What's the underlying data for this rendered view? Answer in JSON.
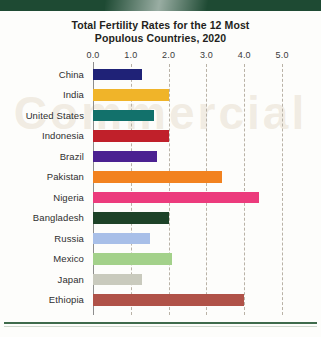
{
  "page": {
    "watermark_text": "Commercial"
  },
  "chart_data": {
    "type": "bar",
    "orientation": "horizontal",
    "title": "Total Fertility Rates for the 12 Most Populous Countries, 2020",
    "title_line1": "Total Fertility Rates for the 12 Most",
    "title_line2": "Populous Countries, 2020",
    "xlabel": "",
    "ylabel": "",
    "xlim": [
      0.0,
      5.5
    ],
    "xticks": [
      0.0,
      1.0,
      2.0,
      3.0,
      4.0,
      5.0
    ],
    "xtick_labels": [
      "0.0",
      "1.0",
      "2.0",
      "3.0",
      "4.0",
      "5.0"
    ],
    "grid": "vertical-dashed",
    "legend": "none",
    "categories": [
      "China",
      "India",
      "United States",
      "Indonesia",
      "Brazil",
      "Pakistan",
      "Nigeria",
      "Bangladesh",
      "Russia",
      "Mexico",
      "Japan",
      "Ethiopia"
    ],
    "values": [
      1.3,
      2.0,
      1.6,
      2.0,
      1.7,
      3.4,
      4.4,
      2.0,
      1.5,
      2.1,
      1.3,
      4.0
    ],
    "colors": [
      "#1f2277",
      "#f0b429",
      "#12716b",
      "#c0202a",
      "#4b2191",
      "#f2821f",
      "#ec3b7c",
      "#1d4228",
      "#a8bfe8",
      "#a3d18a",
      "#c9cabd",
      "#b05248"
    ]
  }
}
